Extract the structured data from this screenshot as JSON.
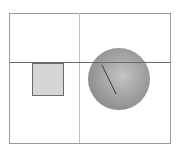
{
  "diagram": {
    "frame": {
      "x": 9,
      "y": 13,
      "width": 161,
      "height": 130,
      "stroke": "#9a9a9a"
    },
    "vertical_divider": {
      "x": 79,
      "stroke": "#b8b8b8"
    },
    "horizontal_line": {
      "y": 62,
      "stroke": "#666666"
    },
    "square": {
      "x": 32,
      "y": 63,
      "width": 31,
      "height": 32,
      "fill": "#d6d6d6",
      "stroke": "#6a6a6a"
    },
    "sphere": {
      "cx": 119,
      "cy": 79,
      "r": 31,
      "light": "#c4c4c4",
      "dark": "#8a8a8a"
    },
    "radius_line": {
      "x1": 102,
      "y1": 65,
      "x2": 116,
      "y2": 94,
      "stroke": "#3a3a3a"
    }
  }
}
